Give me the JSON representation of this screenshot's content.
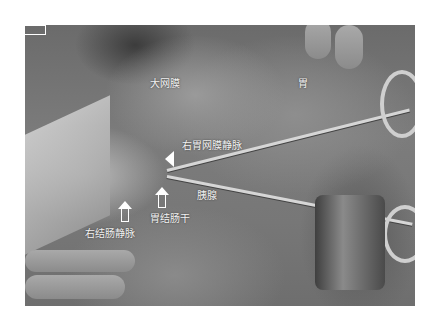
{
  "figure": {
    "labels": {
      "greater_omentum": "大网膜",
      "stomach": "胃",
      "right_gastroepiploic_vein": "右胃网膜静脉",
      "pancreas": "胰腺",
      "gastrocolic_trunk": "胃结肠干",
      "right_colic_vein": "右结肠静脉"
    },
    "colors": {
      "label_text": "#f2f2f2",
      "arrow": "#ffffff",
      "background": "#ffffff"
    }
  }
}
